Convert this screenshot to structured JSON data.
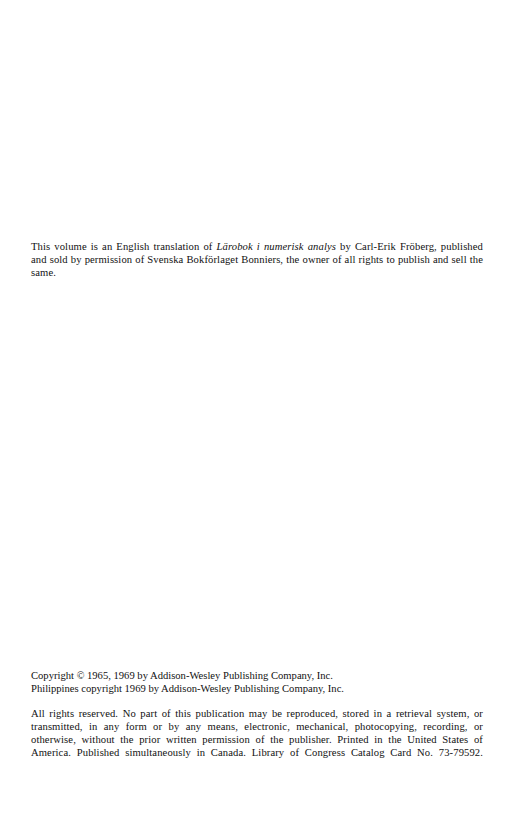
{
  "page": {
    "background_color": "#ffffff",
    "text_color": "#111111"
  },
  "translation_note": {
    "line_1_lead": "This volume is an English translation of ",
    "book_title": "Lärobok i numerisk analys",
    "line_1_tail": " by Carl-Erik Fröberg, published and sold by permission of Svenska Bokförlaget Bonniers, the owner of all rights to publish and sell the same."
  },
  "copyright": {
    "line_1_lead": "Copyright ",
    "copyright_symbol": "©",
    "line_1_tail": " 1965, 1969 by Addison-Wesley Publishing Company, Inc.",
    "line_2": "Philippines copyright 1969 by Addison-Wesley Publishing Company, Inc.",
    "rights_reserved": "All rights reserved.  No part of this publication may be reproduced, stored in a retrieval system, or transmitted, in any form or by any means, electronic, mechanical, photocopying, recording, or otherwise, without the prior written permission of the publisher.  Printed in the United States of America.  Published simultaneously in Canada.  Library of Congress Catalog Card No. 73-79592."
  }
}
